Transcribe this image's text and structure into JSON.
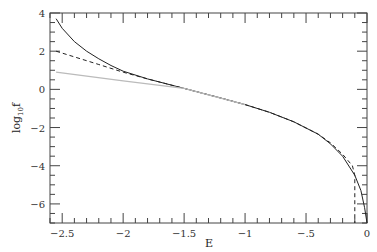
{
  "chart_data": {
    "type": "line",
    "title": "",
    "xlabel": "E",
    "ylabel": "log10 f",
    "ylabel_parts": {
      "base": "log",
      "sub": "10",
      "var": "f"
    },
    "xlim": [
      -2.6,
      0
    ],
    "ylim": [
      -7,
      4
    ],
    "grid": false,
    "legend": "none",
    "x_ticks": [
      -2.5,
      -2,
      -1.5,
      -1,
      -0.5,
      0
    ],
    "x_tick_labels": [
      "-2.5",
      "-2",
      "-1.5",
      "-1",
      "-.5",
      "0"
    ],
    "y_ticks": [
      4,
      2,
      0,
      -2,
      -4,
      -6
    ],
    "y_tick_labels": [
      "4",
      "2",
      "0",
      "-2",
      "-4",
      "-6"
    ],
    "series": [
      {
        "name": "solid",
        "style": "solid",
        "color": "#222222",
        "x": [
          -2.55,
          -2.5,
          -2.4,
          -2.3,
          -2.2,
          -2.1,
          -2.0,
          -1.8,
          -1.5,
          -1.2,
          -1.0,
          -0.8,
          -0.6,
          -0.4,
          -0.3,
          -0.2,
          -0.1,
          -0.05,
          -0.02,
          0.0
        ],
        "y": [
          3.7,
          3.2,
          2.5,
          2.0,
          1.6,
          1.25,
          0.95,
          0.55,
          0.05,
          -0.45,
          -0.8,
          -1.2,
          -1.7,
          -2.35,
          -2.85,
          -3.5,
          -4.5,
          -5.3,
          -6.2,
          -7.0
        ]
      },
      {
        "name": "dashed",
        "style": "dashed",
        "color": "#222222",
        "x": [
          -2.55,
          -2.4,
          -2.2,
          -2.0,
          -1.8,
          -1.5,
          -1.2,
          -1.0,
          -0.8,
          -0.6,
          -0.4,
          -0.3,
          -0.2,
          -0.12,
          -0.1,
          -0.1
        ],
        "y": [
          2.0,
          1.7,
          1.3,
          0.9,
          0.55,
          0.05,
          -0.45,
          -0.8,
          -1.2,
          -1.7,
          -2.35,
          -2.8,
          -3.4,
          -4.0,
          -4.5,
          -7.0
        ]
      },
      {
        "name": "gray",
        "style": "solid",
        "color": "#bbbbbb",
        "x": [
          -2.55,
          -2.0,
          -1.5,
          -1.0
        ],
        "y": [
          0.9,
          0.45,
          0.05,
          -0.8
        ]
      }
    ]
  }
}
